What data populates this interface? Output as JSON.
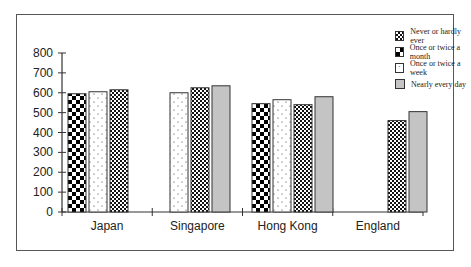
{
  "chart_data": {
    "type": "bar",
    "title": "",
    "xlabel": "",
    "ylabel": "",
    "ylim": [
      0,
      800
    ],
    "yticks": [
      0,
      100,
      200,
      300,
      400,
      500,
      600,
      700,
      800
    ],
    "categories": [
      "Japan",
      "Singapore",
      "Hong Kong",
      "England"
    ],
    "series": [
      {
        "name": "Never or hardly ever",
        "values": [
          null,
          null,
          null,
          null
        ]
      },
      {
        "name": "Once or twice a month",
        "values": [
          595,
          null,
          545,
          null
        ]
      },
      {
        "name": "Once or twice a week",
        "values": [
          605,
          600,
          565,
          null
        ]
      },
      {
        "name": "Nearly every day",
        "values": [
          null,
          635,
          580,
          505
        ]
      }
    ],
    "extra_series_note": "checkered small pattern bars",
    "patterned_small_check": [
      615,
      625,
      540,
      460
    ],
    "legend_position": "top-right",
    "grid": false
  },
  "legend": [
    {
      "label": "Never or hardly ever",
      "pattern": "fine-check"
    },
    {
      "label": "Once or twice a month",
      "pattern": "large-check"
    },
    {
      "label": "Once or twice a week",
      "pattern": "dots"
    },
    {
      "label": "Nearly every day",
      "pattern": "gray"
    }
  ]
}
